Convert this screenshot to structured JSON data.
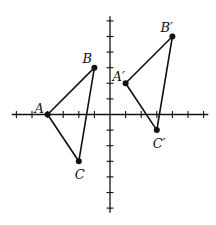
{
  "chart_data": {
    "type": "scatter",
    "title": "",
    "xlabel": "",
    "ylabel": "",
    "xlim": [
      -6,
      6
    ],
    "ylim": [
      -6,
      6
    ],
    "tick_step": 1,
    "grid": false,
    "shapes": [
      {
        "name": "triangle-ABC",
        "vertices": [
          {
            "label": "A",
            "x": -4,
            "y": 0,
            "label_pos": "left"
          },
          {
            "label": "B",
            "x": -1,
            "y": 3,
            "label_pos": "top-left"
          },
          {
            "label": "C",
            "x": -2,
            "y": -3,
            "label_pos": "bottom"
          }
        ]
      },
      {
        "name": "triangle-A-prime-B-prime-C-prime",
        "vertices": [
          {
            "label": "A′",
            "x": 1,
            "y": 2,
            "label_pos": "left"
          },
          {
            "label": "B′",
            "x": 4,
            "y": 5,
            "label_pos": "top-left"
          },
          {
            "label": "C′",
            "x": 3,
            "y": -1,
            "label_pos": "bottom"
          }
        ]
      }
    ]
  }
}
